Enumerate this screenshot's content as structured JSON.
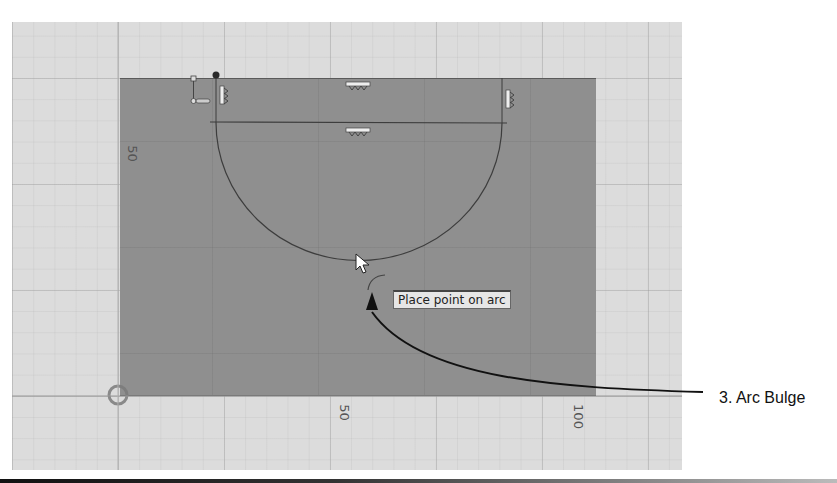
{
  "canvas": {
    "background_color": "#dcdcdc",
    "sketch_fill_color": "#8f8f8f",
    "origin_marker": "origin-circle-icon"
  },
  "dimensions": {
    "y_axis_label": "50",
    "x_axis_label_mid": "50",
    "x_axis_label_end": "100"
  },
  "constraint_icons": [
    {
      "name": "horizontal-constraint-icon",
      "position": "top-center"
    },
    {
      "name": "horizontal-constraint-icon",
      "position": "diameter-center"
    },
    {
      "name": "vertical-constraint-icon",
      "position": "top-left"
    },
    {
      "name": "vertical-constraint-icon",
      "position": "top-right"
    },
    {
      "name": "coincident-constraint-icon",
      "position": "top-left-corner"
    }
  ],
  "cursor": {
    "type": "arrow-cursor-icon",
    "tooltip": "Place point on arc"
  },
  "annotation": {
    "callout_label": "3. Arc Bulge",
    "arrow_color": "#111111"
  }
}
